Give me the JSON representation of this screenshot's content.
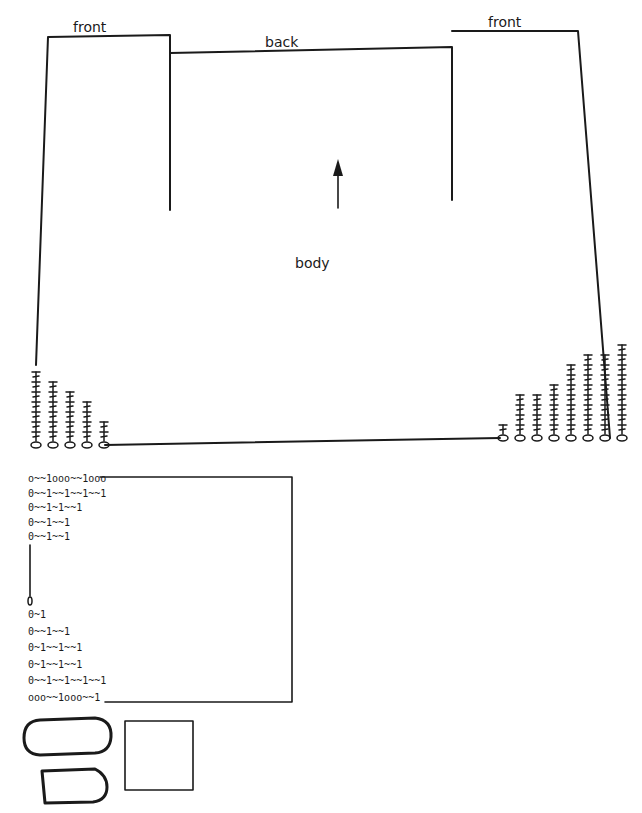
{
  "body_panel": {
    "labels": {
      "front_left": "front",
      "back": "back",
      "front_right": "front",
      "body": "body"
    },
    "direction_arrow": "up"
  },
  "corner_charts": {
    "left": {
      "columns": [
        7,
        6,
        5,
        4,
        2
      ],
      "symbols": [
        "treble",
        "chain-oval",
        "chain-stack"
      ]
    },
    "right": {
      "columns": [
        1,
        4,
        4,
        5,
        7,
        8,
        8,
        9
      ],
      "symbols": [
        "treble",
        "chain-oval",
        "chain-stack"
      ]
    }
  },
  "sleeve_chart": {
    "rows_top": [
      "o~~1ooo~~1ooo",
      "0~~1~~1~~1~~1",
      "0~~1~1~~1",
      "0~~1~~1",
      "0~~1~~1"
    ],
    "rows_bottom": [
      "0~1",
      "0~~1~~1",
      "0~1~~1~~1",
      "0~1~~1~~1",
      "0~~1~~1~~1~~1",
      "ooo~~1ooo~~1"
    ]
  },
  "pieces": [
    {
      "name": "oval-piece",
      "shape": "rounded-oblong"
    },
    {
      "name": "half-round-piece",
      "shape": "d-shape"
    },
    {
      "name": "square-piece",
      "shape": "square"
    }
  ]
}
